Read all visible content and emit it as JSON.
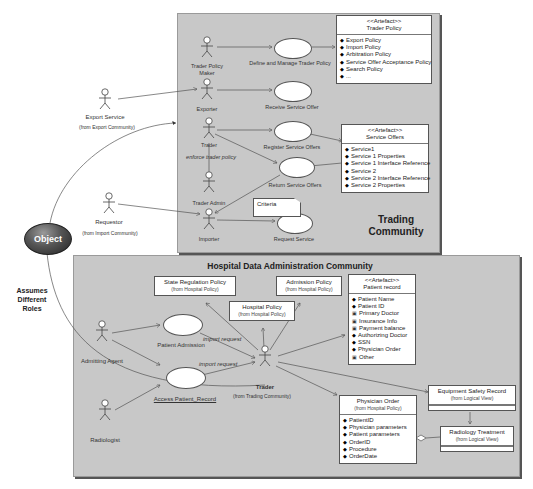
{
  "central_object": {
    "label": "Object",
    "caption": [
      "Assumes",
      "Different",
      "Roles"
    ]
  },
  "trading_community": {
    "title": [
      "Trading",
      "Community"
    ],
    "actors": [
      {
        "name": "Trader Policy Maker",
        "lines": [
          "Trader Policy",
          "Maker"
        ]
      },
      {
        "name": "Exporter"
      },
      {
        "name": "Trader"
      },
      {
        "name": "Trader Admin"
      },
      {
        "name": "Importer"
      }
    ],
    "trader_annotation": "enforce trader policy",
    "use_cases": [
      "Define and Manage Trader Policy",
      "Receive Service Offer",
      "Register Service Offers",
      "Return Service Offers",
      "Request Service"
    ],
    "note": "Criteria",
    "trader_policy_artifact": {
      "stereotype": "<<Artefact>>",
      "name": "Trader Policy",
      "items": [
        "Export Policy",
        "Import Policy",
        "Arbitration Policy",
        "Service Offer Acceptance Policy",
        "Search Policy",
        "..."
      ]
    },
    "service_offers_artifact": {
      "stereotype": "<<Artefact>>",
      "name": "Service Offers",
      "items": [
        "Service1",
        "Service 1 Properties",
        "Service 1 Interface Reference",
        "Service 2",
        "Service 2 Interface Reference",
        "Service 2 Properties"
      ]
    }
  },
  "external_actors": [
    {
      "name": "Export Service",
      "from": "(from Export Community)"
    },
    {
      "name": "Requestor",
      "from": "(from Import Community)"
    }
  ],
  "hospital_community": {
    "title": "Hospital Data Administration Community",
    "actors": [
      {
        "name": "Admitting Agent"
      },
      {
        "name": "Radiologist"
      },
      {
        "name": "Trader",
        "from": "(from Trading Community)"
      }
    ],
    "use_cases": [
      "Patient Admission",
      "Access Patient_Record"
    ],
    "relation_labels": [
      "import request",
      "import request"
    ],
    "policies": [
      {
        "name": "State Regulation Policy",
        "from": "(from Hospital Policy)"
      },
      {
        "name": "Hospital Policy",
        "from": "(from Hospital Policy)"
      },
      {
        "name": "Admission Policy",
        "from": "(from Hospital Policy)"
      }
    ],
    "patient_record_artifact": {
      "stereotype": "<<Artefact>>",
      "name": "Patient record",
      "items": [
        {
          "label": "Patient Name",
          "locked": false
        },
        {
          "label": "Patient ID",
          "locked": false
        },
        {
          "label": "Primary Doctor",
          "locked": true
        },
        {
          "label": "Insurance Info",
          "locked": true
        },
        {
          "label": "Payment balance",
          "locked": true
        },
        {
          "label": "Authorizing Doctor",
          "locked": false
        },
        {
          "label": "SSN",
          "locked": false
        },
        {
          "label": "Physician Order",
          "locked": false
        },
        {
          "label": "Other",
          "locked": true
        }
      ]
    },
    "physician_order": {
      "name": "Physician Order",
      "from": "(from Hospital Policy)",
      "items": [
        "PatientID",
        "Physician parameters",
        "Patient parameters",
        "OrderID",
        "Procedure",
        "OrderDate"
      ]
    },
    "equipment_safety_record": {
      "name": "Equipment Safety Record",
      "from": "(from Logical View)"
    },
    "radiology_treatment": {
      "name": "Radiology Treatment",
      "from": "(from Logical View)"
    }
  }
}
